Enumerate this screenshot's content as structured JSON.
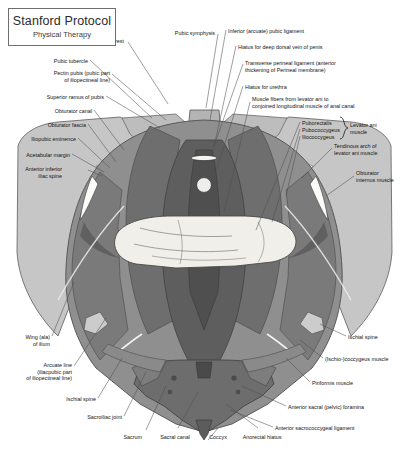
{
  "title_plate": {
    "main": "Stanford Protocol",
    "sub": "Physical Therapy"
  },
  "figure": {
    "name": "pelvic-floor-superior-view",
    "palette": {
      "background": "#ffffff",
      "bone_light": "#c9c9c9",
      "bone_mid": "#b0b0b0",
      "muscle_mid": "#8d8d8d",
      "muscle_dark": "#6e6e6e",
      "muscle_darkest": "#5a5a5a",
      "highlight": "#f2f2ef",
      "outline": "#4a4a4a",
      "leader_line": "#4f4f4f"
    }
  },
  "labels": [
    {
      "id": "pubic-crest",
      "text": "Pubic crest",
      "align": "right",
      "x": 124,
      "y": 38
    },
    {
      "id": "pubic-symphysis",
      "text": "Pubic symphysis",
      "align": "right",
      "x": 215,
      "y": 30
    },
    {
      "id": "inferior-arcuate-pubic-ligament",
      "text": "Inferior (arcuate) pubic ligament",
      "align": "left",
      "x": 228,
      "y": 28
    },
    {
      "id": "hiatus-deep-dorsal-vein",
      "text": "Hiatus for deep dorsal vein of penis",
      "align": "left",
      "x": 238,
      "y": 44
    },
    {
      "id": "transverse-perineal-ligament",
      "text": "Transverse perineal ligament (anterior\nthickening of Perineal membrane)",
      "align": "left",
      "x": 245,
      "y": 60
    },
    {
      "id": "hiatus-for-urethra",
      "text": "Hiatus for urethra",
      "align": "left",
      "x": 245,
      "y": 84
    },
    {
      "id": "muscle-fibers-levator-ani",
      "text": "Muscle fibers from levator ani to\nconjoined longitudinal muscle of anal canal",
      "align": "left",
      "x": 252,
      "y": 96
    },
    {
      "id": "puborectalis",
      "text": "Puborectalis",
      "align": "left",
      "x": 302,
      "y": 120
    },
    {
      "id": "pubococcygeus",
      "text": "Pubococcygeus",
      "align": "left",
      "x": 302,
      "y": 127
    },
    {
      "id": "iliococcygeus",
      "text": "Iliococcygeus",
      "align": "left",
      "x": 302,
      "y": 134
    },
    {
      "id": "levator-ani-muscle",
      "text": "Levator ani\nmuscle",
      "align": "left",
      "x": 350,
      "y": 122
    },
    {
      "id": "tendinous-arch-levator-ani",
      "text": "Tendinous arch of\nlevator ani muscle",
      "align": "left",
      "x": 334,
      "y": 143
    },
    {
      "id": "obturator-internus-muscle",
      "text": "Obturator\ninternus muscle",
      "align": "left",
      "x": 356,
      "y": 170
    },
    {
      "id": "ischial-spine-right",
      "text": "Ischial spine",
      "align": "left",
      "x": 348,
      "y": 334
    },
    {
      "id": "ischio-coccygeus-muscle",
      "text": "(Ischio-)coccygeus muscle",
      "align": "left",
      "x": 325,
      "y": 356
    },
    {
      "id": "piriformis-muscle",
      "text": "Piriformis muscle",
      "align": "left",
      "x": 312,
      "y": 380
    },
    {
      "id": "anterior-sacral-foramina",
      "text": "Anterior sacral (pelvic) foramina",
      "align": "left",
      "x": 288,
      "y": 404
    },
    {
      "id": "anterior-sacrococcygeal-ligament",
      "text": "Anterior sacrococcygeal ligament",
      "align": "left",
      "x": 275,
      "y": 425
    },
    {
      "id": "pubic-tubercle",
      "text": "Pubic tubercle",
      "align": "right",
      "x": 88,
      "y": 58
    },
    {
      "id": "pectin-pubis",
      "text": "Pectin pubis (pubic part\nof iliopectineal line)",
      "align": "right",
      "x": 110,
      "y": 70
    },
    {
      "id": "superior-ramus-of-pubis",
      "text": "Superior ramus of pubis",
      "align": "right",
      "x": 104,
      "y": 94
    },
    {
      "id": "obturator-canal",
      "text": "Obturator canal",
      "align": "right",
      "x": 92,
      "y": 108
    },
    {
      "id": "obturator-fascia",
      "text": "Obturator fascia",
      "align": "right",
      "x": 86,
      "y": 122
    },
    {
      "id": "iliopubic-eminence",
      "text": "Iliopubic eminence",
      "align": "right",
      "x": 76,
      "y": 136
    },
    {
      "id": "acetabular-margin",
      "text": "Acetabular margin",
      "align": "right",
      "x": 70,
      "y": 152
    },
    {
      "id": "anterior-inferior-iliac-spine",
      "text": "Anterior inferior\niliac spine",
      "align": "right",
      "x": 62,
      "y": 166
    },
    {
      "id": "wing-ala-of-ilium",
      "text": "Wing (ala)\nof ilium",
      "align": "right",
      "x": 50,
      "y": 334
    },
    {
      "id": "arcuate-line",
      "text": "Arcuate line\n(iliacpubic part\nof iliopectineal line)",
      "align": "right",
      "x": 72,
      "y": 362
    },
    {
      "id": "ischial-spine-left",
      "text": "Ischial spine",
      "align": "right",
      "x": 96,
      "y": 396
    },
    {
      "id": "sacroiliac-joint",
      "text": "Sacroiliac joint",
      "align": "right",
      "x": 122,
      "y": 414
    },
    {
      "id": "sacrum",
      "text": "Sacrum",
      "align": "right",
      "x": 142,
      "y": 434
    },
    {
      "id": "sacral-canal",
      "text": "Sacral canal",
      "align": "center",
      "x": 175,
      "y": 434
    },
    {
      "id": "coccyx",
      "text": "Coccyx",
      "align": "center",
      "x": 218,
      "y": 434
    },
    {
      "id": "anorectal-hiatus",
      "text": "Anorectal hiatus",
      "align": "center",
      "x": 262,
      "y": 434
    }
  ]
}
